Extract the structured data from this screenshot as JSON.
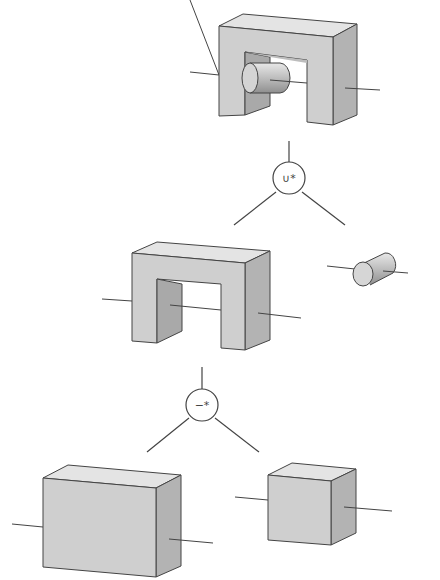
{
  "diagram": {
    "type": "csg-tree",
    "nodes": [
      {
        "id": "result",
        "kind": "solid",
        "description": "U-shaped block with cylinder united into its opening"
      },
      {
        "id": "union",
        "kind": "operator",
        "label": "∪*"
      },
      {
        "id": "u-block",
        "kind": "solid",
        "description": "U-shaped block"
      },
      {
        "id": "cylinder",
        "kind": "solid",
        "description": "Cylinder"
      },
      {
        "id": "difference",
        "kind": "operator",
        "label": "−*"
      },
      {
        "id": "large-box",
        "kind": "solid",
        "description": "Large rectangular box"
      },
      {
        "id": "small-box",
        "kind": "solid",
        "description": "Small cube"
      }
    ],
    "edges": [
      [
        "union",
        "result"
      ],
      [
        "union",
        "u-block"
      ],
      [
        "union",
        "cylinder"
      ],
      [
        "difference",
        "u-block"
      ],
      [
        "difference",
        "large-box"
      ],
      [
        "difference",
        "small-box"
      ]
    ],
    "colors": {
      "front_face": "#cfcfcf",
      "top_face": "#e4e4e4",
      "side_face": "#b3b3b3",
      "inner_face": "#a9a9a9",
      "stroke": "#444444"
    }
  }
}
